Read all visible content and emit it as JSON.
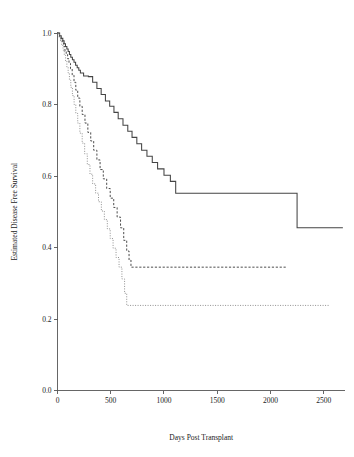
{
  "figure": {
    "title": "",
    "background_color": "#ffffff"
  },
  "chart_data": {
    "type": "line",
    "subtype": "kaplan-meier-step",
    "title": "",
    "xlabel": "Days Post Transplant",
    "ylabel": "Estimated Disease Free Survival",
    "xlim": [
      0,
      2700
    ],
    "ylim": [
      0.0,
      1.0
    ],
    "grid": false,
    "legend": "none",
    "xticks": [
      0,
      500,
      1000,
      1500,
      2000,
      2500
    ],
    "xtick_labels": [
      "0",
      "500",
      "1000",
      "1500",
      "2000",
      "2500"
    ],
    "yticks": [
      0.0,
      0.2,
      0.4,
      0.6,
      0.8,
      1.0
    ],
    "ytick_labels": [
      "0.0",
      "0.2",
      "0.4",
      "0.6",
      "0.8",
      "1.0"
    ],
    "series": [
      {
        "name": "group-1-solid",
        "line_style": "solid",
        "color": "#444444",
        "final_value": 0.455,
        "x": [
          0,
          20,
          35,
          50,
          62,
          75,
          88,
          100,
          112,
          125,
          140,
          155,
          170,
          185,
          200,
          215,
          245,
          290,
          330,
          370,
          410,
          450,
          490,
          530,
          570,
          615,
          660,
          700,
          745,
          790,
          840,
          890,
          940,
          1000,
          1060,
          1110,
          2250,
          2680
        ],
        "y": [
          1.0,
          0.992,
          0.985,
          0.978,
          0.97,
          0.962,
          0.955,
          0.948,
          0.94,
          0.932,
          0.925,
          0.918,
          0.91,
          0.903,
          0.896,
          0.888,
          0.88,
          0.878,
          0.862,
          0.845,
          0.828,
          0.81,
          0.795,
          0.778,
          0.76,
          0.742,
          0.725,
          0.708,
          0.69,
          0.672,
          0.655,
          0.638,
          0.62,
          0.602,
          0.585,
          0.552,
          0.455,
          0.455
        ]
      },
      {
        "name": "group-2-dashed",
        "line_style": "dashed",
        "color": "#4d4d4d",
        "final_value": 0.345,
        "x": [
          0,
          18,
          32,
          45,
          58,
          70,
          82,
          95,
          108,
          122,
          138,
          155,
          172,
          190,
          210,
          232,
          258,
          285,
          312,
          340,
          370,
          400,
          430,
          462,
          495,
          528,
          560,
          592,
          622,
          650,
          672,
          690,
          2150
        ],
        "y": [
          1.0,
          0.99,
          0.982,
          0.972,
          0.962,
          0.95,
          0.94,
          0.928,
          0.915,
          0.9,
          0.882,
          0.862,
          0.84,
          0.818,
          0.795,
          0.772,
          0.748,
          0.722,
          0.698,
          0.672,
          0.645,
          0.618,
          0.592,
          0.565,
          0.538,
          0.512,
          0.485,
          0.455,
          0.42,
          0.39,
          0.365,
          0.345,
          0.345
        ]
      },
      {
        "name": "group-3-dotted",
        "line_style": "dotted",
        "color": "#8a8a8a",
        "final_value": 0.238,
        "x": [
          0,
          15,
          28,
          40,
          52,
          64,
          76,
          88,
          100,
          112,
          125,
          140,
          156,
          172,
          190,
          210,
          232,
          255,
          280,
          305,
          330,
          358,
          385,
          412,
          440,
          468,
          495,
          522,
          550,
          578,
          605,
          630,
          650,
          2550
        ],
        "y": [
          1.0,
          0.988,
          0.978,
          0.965,
          0.952,
          0.938,
          0.922,
          0.905,
          0.888,
          0.868,
          0.848,
          0.825,
          0.8,
          0.775,
          0.748,
          0.72,
          0.692,
          0.662,
          0.632,
          0.605,
          0.578,
          0.552,
          0.528,
          0.502,
          0.478,
          0.452,
          0.425,
          0.398,
          0.372,
          0.345,
          0.312,
          0.272,
          0.238,
          0.238
        ]
      }
    ]
  }
}
